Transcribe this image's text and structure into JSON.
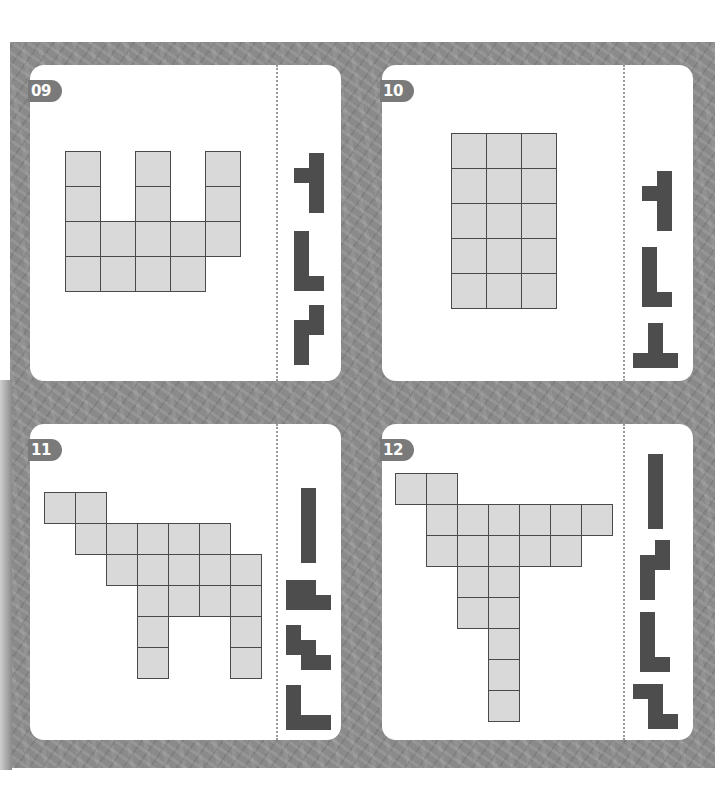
{
  "page": {
    "background_color": "#8a8a8a",
    "card_color": "#ffffff",
    "board_cell_color": "#d9d9d9",
    "piece_color": "#4d4d4d"
  },
  "puzzles": [
    {
      "number": "09",
      "card": {
        "x": 30,
        "y": 65
      },
      "divider_x": 246,
      "board": {
        "x": 35,
        "y": 86,
        "cell": 35,
        "rows": [
          [
            0,
            2,
            4
          ],
          [
            0,
            2,
            4
          ],
          [
            0,
            1,
            2,
            3,
            4
          ],
          [
            0,
            1,
            2,
            3
          ]
        ]
      },
      "pieces": [
        {
          "x": 264,
          "y": 88,
          "cell": 15,
          "cells": [
            [
              1,
              0
            ],
            [
              0,
              1
            ],
            [
              1,
              1
            ],
            [
              1,
              2
            ],
            [
              1,
              3
            ]
          ]
        },
        {
          "x": 264,
          "y": 166,
          "cell": 15,
          "cells": [
            [
              0,
              0
            ],
            [
              0,
              1
            ],
            [
              0,
              2
            ],
            [
              0,
              3
            ],
            [
              1,
              3
            ]
          ]
        },
        {
          "x": 264,
          "y": 240,
          "cell": 15,
          "cells": [
            [
              1,
              0
            ],
            [
              0,
              1
            ],
            [
              1,
              1
            ],
            [
              0,
              2
            ],
            [
              0,
              3
            ]
          ]
        }
      ]
    },
    {
      "number": "10",
      "card": {
        "x": 382,
        "y": 65
      },
      "divider_x": 241,
      "board": {
        "x": 69,
        "y": 68,
        "cell": 35,
        "rows": [
          [
            0,
            1,
            2
          ],
          [
            0,
            1,
            2
          ],
          [
            0,
            1,
            2
          ],
          [
            0,
            1,
            2
          ],
          [
            0,
            1,
            2
          ]
        ]
      },
      "pieces": [
        {
          "x": 260,
          "y": 106,
          "cell": 15,
          "cells": [
            [
              1,
              0
            ],
            [
              0,
              1
            ],
            [
              1,
              1
            ],
            [
              1,
              2
            ],
            [
              1,
              3
            ]
          ]
        },
        {
          "x": 260,
          "y": 182,
          "cell": 15,
          "cells": [
            [
              0,
              0
            ],
            [
              0,
              1
            ],
            [
              0,
              2
            ],
            [
              0,
              3
            ],
            [
              1,
              3
            ]
          ]
        },
        {
          "x": 251,
          "y": 258,
          "cell": 15,
          "cells": [
            [
              1,
              0
            ],
            [
              1,
              1
            ],
            [
              0,
              2
            ],
            [
              1,
              2
            ],
            [
              2,
              2
            ]
          ]
        }
      ]
    },
    {
      "number": "11",
      "card": {
        "x": 30,
        "y": 424
      },
      "divider_x": 246,
      "board": {
        "x": 14,
        "y": 68,
        "cell": 31,
        "rows": [
          [
            0,
            1
          ],
          [
            1,
            2,
            3,
            4,
            5
          ],
          [
            2,
            3,
            4,
            5,
            6
          ],
          [
            3,
            4,
            5,
            6
          ],
          [
            3,
            6
          ],
          [
            3,
            6
          ]
        ]
      },
      "pieces": [
        {
          "x": 271,
          "y": 64,
          "cell": 15,
          "cells": [
            [
              0,
              0
            ],
            [
              0,
              1
            ],
            [
              0,
              2
            ],
            [
              0,
              3
            ],
            [
              0,
              4
            ]
          ]
        },
        {
          "x": 256,
          "y": 156,
          "cell": 15,
          "cells": [
            [
              0,
              0
            ],
            [
              1,
              0
            ],
            [
              0,
              1
            ],
            [
              1,
              1
            ],
            [
              2,
              1
            ]
          ]
        },
        {
          "x": 256,
          "y": 201,
          "cell": 15,
          "cells": [
            [
              0,
              0
            ],
            [
              0,
              1
            ],
            [
              1,
              1
            ],
            [
              1,
              2
            ],
            [
              2,
              2
            ]
          ]
        },
        {
          "x": 256,
          "y": 261,
          "cell": 15,
          "cells": [
            [
              0,
              0
            ],
            [
              0,
              1
            ],
            [
              0,
              2
            ],
            [
              1,
              2
            ],
            [
              2,
              2
            ]
          ]
        }
      ]
    },
    {
      "number": "12",
      "card": {
        "x": 382,
        "y": 424
      },
      "divider_x": 241,
      "board": {
        "x": 13,
        "y": 49,
        "cell": 31,
        "rows": [
          [
            0,
            1
          ],
          [
            1,
            2,
            3,
            4,
            5,
            6
          ],
          [
            1,
            2,
            3,
            4,
            5
          ],
          [
            2,
            3
          ],
          [
            2,
            3
          ],
          [
            3
          ],
          [
            3
          ],
          [
            3
          ]
        ]
      },
      "pieces": [
        {
          "x": 266,
          "y": 30,
          "cell": 15,
          "cells": [
            [
              0,
              0
            ],
            [
              0,
              1
            ],
            [
              0,
              2
            ],
            [
              0,
              3
            ],
            [
              0,
              4
            ]
          ]
        },
        {
          "x": 258,
          "y": 116,
          "cell": 15,
          "cells": [
            [
              1,
              0
            ],
            [
              0,
              1
            ],
            [
              1,
              1
            ],
            [
              0,
              2
            ],
            [
              0,
              3
            ]
          ]
        },
        {
          "x": 258,
          "y": 188,
          "cell": 15,
          "cells": [
            [
              0,
              0
            ],
            [
              0,
              1
            ],
            [
              0,
              2
            ],
            [
              0,
              3
            ],
            [
              1,
              3
            ]
          ]
        },
        {
          "x": 251,
          "y": 260,
          "cell": 15,
          "cells": [
            [
              0,
              0
            ],
            [
              1,
              0
            ],
            [
              1,
              1
            ],
            [
              1,
              2
            ],
            [
              2,
              2
            ]
          ]
        }
      ]
    }
  ]
}
